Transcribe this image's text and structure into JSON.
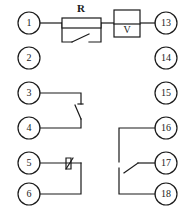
{
  "diagram": {
    "kind": "electrical-terminal-wiring-diagram",
    "width": 193,
    "height": 216,
    "background_color": "#ffffff",
    "line_color": "#1a1a1a",
    "terminals_left": [
      {
        "number": "1",
        "cx": 29,
        "cy": 23,
        "r": 11
      },
      {
        "number": "2",
        "cx": 29,
        "cy": 58,
        "r": 11
      },
      {
        "number": "3",
        "cx": 29,
        "cy": 93,
        "r": 11
      },
      {
        "number": "4",
        "cx": 29,
        "cy": 128,
        "r": 11
      },
      {
        "number": "5",
        "cx": 29,
        "cy": 163,
        "r": 11
      },
      {
        "number": "6",
        "cx": 29,
        "cy": 194,
        "r": 11
      }
    ],
    "terminals_right": [
      {
        "number": "13",
        "cx": 166,
        "cy": 23,
        "r": 11
      },
      {
        "number": "14",
        "cx": 166,
        "cy": 58,
        "r": 11
      },
      {
        "number": "15",
        "cx": 166,
        "cy": 93,
        "r": 11
      },
      {
        "number": "16",
        "cx": 166,
        "cy": 128,
        "r": 11
      },
      {
        "number": "17",
        "cx": 166,
        "cy": 163,
        "r": 11
      },
      {
        "number": "18",
        "cx": 166,
        "cy": 194,
        "r": 11
      }
    ],
    "components": [
      {
        "id": "resistor",
        "label": "R",
        "label_x": 81,
        "label_y": 13,
        "x": 62,
        "y": 19,
        "w": 39,
        "h": 9
      },
      {
        "id": "voltmeter",
        "label": "V",
        "label_x": 127,
        "label_y": 31,
        "x": 114,
        "y": 11,
        "w": 26,
        "h": 26,
        "divider_y": 24
      }
    ],
    "wires": {
      "top_branch": "M40,23 L62,23 M101,23 L114,23 M140,23 L155,23 M62,23 L62,42 L101,42 L101,23",
      "switch_blade_top": "M72,42 L89,34",
      "circuit_3_4": "M40,93 L80,93 L80,105 M40,128 L80,128 L80,118",
      "switch_blade_34": "M80,118 L76,105",
      "circuit_5_6": "M40,163 L80,163 M40,194 L80,194 L80,163",
      "switch_5": "M66,163 L72,163",
      "changeover_16_18": "M155,128 L118,128 L118,163 M155,194 L118,194 L118,168",
      "switch_blade_17": "M155,163 L138,163 L124,172"
    }
  }
}
